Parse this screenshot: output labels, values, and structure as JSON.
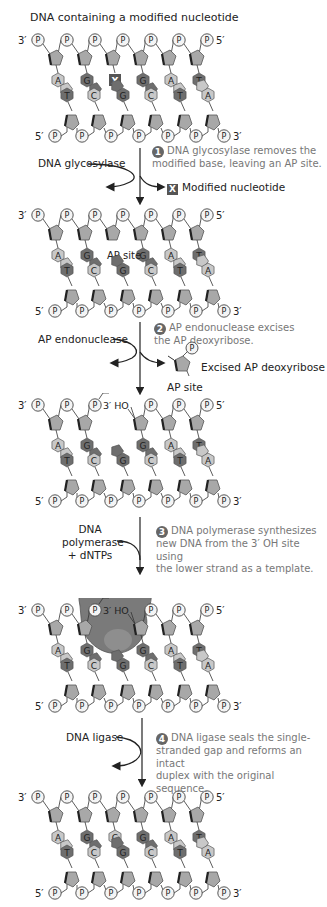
{
  "title": "DNA containing a modified nucleotide",
  "colors": {
    "sugar": "#a8a8a8",
    "sugar_stroke": "#555555",
    "purine_dark": "#6e6e6e",
    "pyrimidine_light": "#c8c8c8",
    "modified": "#555555",
    "badge": "#666666",
    "step_text": "#777777",
    "polymerase": "#7a7a7a"
  },
  "strand_labels": {
    "top_left": "3′",
    "top_right": "5′",
    "bottom_left": "5′",
    "bottom_right": "3′",
    "phosphate": "P"
  },
  "panels": [
    {
      "id": "initial",
      "top_bases": [
        "A",
        "G",
        "X",
        "G",
        "A",
        "T"
      ],
      "bottom_bases": [
        "T",
        "C",
        "G",
        "C",
        "T",
        "A"
      ]
    },
    {
      "id": "ap-site",
      "top_bases": [
        "A",
        "G",
        "",
        "G",
        "A",
        "T"
      ],
      "bottom_bases": [
        "T",
        "C",
        "G",
        "C",
        "T",
        "A"
      ],
      "gap_label": "AP site"
    },
    {
      "id": "nicked",
      "top_bases": [
        "A",
        "G",
        "",
        "G",
        "A",
        "T"
      ],
      "bottom_bases": [
        "T",
        "C",
        "G",
        "C",
        "T",
        "A"
      ],
      "end_labels": {
        "five_prime": "5′",
        "three_prime_oh": "3′ HO",
        "three_prime": "3′"
      }
    },
    {
      "id": "polymerase",
      "top_bases": [
        "A",
        "G",
        "",
        "G",
        "A",
        "T"
      ],
      "bottom_bases": [
        "T",
        "C",
        "G",
        "C",
        "T",
        "A"
      ],
      "end_labels": {
        "five_prime": "5′",
        "three_prime_oh": "3′ HO"
      }
    },
    {
      "id": "repaired",
      "top_bases": [
        "A",
        "G",
        "C",
        "G",
        "A",
        "T"
      ],
      "bottom_bases": [
        "T",
        "C",
        "G",
        "C",
        "T",
        "A"
      ]
    }
  ],
  "steps": [
    {
      "num": "1",
      "text_line1": "DNA glycosylase removes the",
      "text_line2": "modified base, leaving an AP site.",
      "enzyme": "DNA glycosylase",
      "product": "Modified nucleotide",
      "product_badge": "X"
    },
    {
      "num": "2",
      "text_line1": "AP endonuclease excises",
      "text_line2": "the AP deoxyribose.",
      "enzyme": "AP endonuclease",
      "product": "Excised AP deoxyribose",
      "product_sublabel": "AP site"
    },
    {
      "num": "3",
      "text_line1": "DNA polymerase synthesizes",
      "text_line2": "new DNA from the 3′ OH site using",
      "text_line3": "the lower strand as a template.",
      "enzyme_line1": "DNA",
      "enzyme_line2": "polymerase",
      "enzyme_line3": "+ dNTPs"
    },
    {
      "num": "4",
      "text_line1": "DNA ligase seals the single-",
      "text_line2": "stranded gap and reforms an intact",
      "text_line3": "duplex with the original sequence.",
      "enzyme": "DNA ligase"
    }
  ]
}
